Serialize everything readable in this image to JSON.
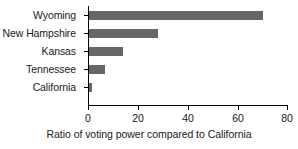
{
  "chart_data": {
    "type": "bar",
    "orientation": "horizontal",
    "title": "",
    "subtitle": "",
    "xlabel": "Ratio of voting power compared to California",
    "ylabel": "",
    "categories": [
      "Wyoming",
      "New Hampshire",
      "Kansas",
      "Tennessee",
      "California"
    ],
    "values": [
      70,
      27.7,
      13.7,
      6.4,
      1.2
    ],
    "xlim": [
      0,
      80
    ],
    "xticks": [
      0,
      20,
      40,
      60,
      80
    ],
    "xtick_labels": [
      "0",
      "20",
      "40",
      "60",
      "80"
    ],
    "grid": false,
    "legend": null,
    "legend_position": "none",
    "bar_color": "#666666",
    "axis_color": "#000000",
    "background_color": "#ffffff",
    "annotations": []
  }
}
